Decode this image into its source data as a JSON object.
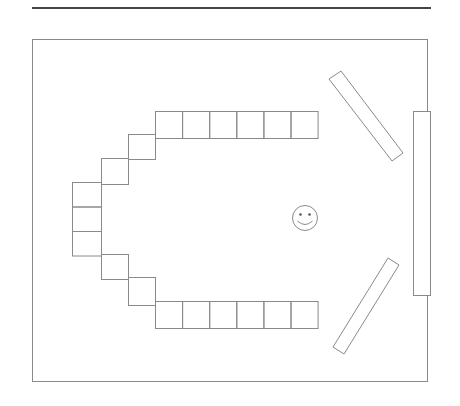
{
  "diagram": {
    "colors": {
      "stroke": "#8a8a8a",
      "rule": "#444444",
      "background": "#ffffff"
    },
    "room": {
      "label": "room-outline"
    },
    "desk_groups": [
      {
        "name": "top-row",
        "count": 6
      },
      {
        "name": "upper-diagonal",
        "count": 2
      },
      {
        "name": "left-column",
        "count": 3
      },
      {
        "name": "lower-diagonal",
        "count": 2
      },
      {
        "name": "bottom-row",
        "count": 6
      }
    ],
    "total_desks": 19,
    "teacher": {
      "icon": "smiley-face-icon"
    },
    "boards": [
      {
        "name": "upper-slanted-board"
      },
      {
        "name": "front-board"
      },
      {
        "name": "lower-slanted-board"
      }
    ]
  }
}
